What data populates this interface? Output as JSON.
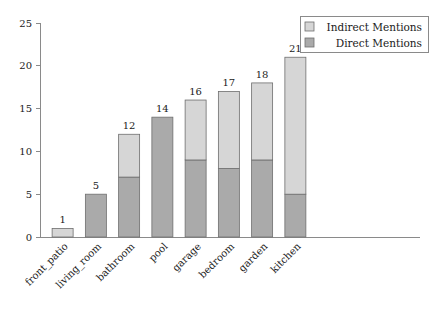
{
  "chart_data": {
    "type": "bar",
    "subtype": "stacked-vertical",
    "title": "",
    "subtitle": "",
    "xlabel": "",
    "ylabel": "",
    "categories": [
      "front_patio",
      "living_room",
      "bathroom",
      "pool",
      "garage",
      "bedroom",
      "garden",
      "kitchen"
    ],
    "series": [
      {
        "name": "Direct Mentions",
        "color": "#aaaaaa",
        "values": [
          0,
          5,
          7,
          14,
          9,
          8,
          9,
          5
        ]
      },
      {
        "name": "Indirect Mentions",
        "color": "#d6d6d6",
        "values": [
          1,
          0,
          5,
          0,
          7,
          9,
          9,
          16
        ]
      }
    ],
    "totals": [
      1,
      5,
      12,
      14,
      16,
      17,
      18,
      21
    ],
    "total_labels": [
      "1",
      "5",
      "12",
      "14",
      "16",
      "17",
      "18",
      "21"
    ],
    "ylim": [
      0,
      25
    ],
    "yticks": [
      0,
      5,
      10,
      15,
      20,
      25
    ],
    "ytick_labels": [
      "0",
      "5",
      "10",
      "15",
      "20",
      "25"
    ],
    "grid": false,
    "legend_position": "top-right",
    "legend_entries": [
      {
        "label": "Indirect Mentions",
        "color": "#d6d6d6"
      },
      {
        "label": "Direct Mentions",
        "color": "#aaaaaa"
      }
    ],
    "axis_color": "#8a8a8a",
    "bar_edge_color": "#6e6e6e",
    "background": "#ffffff"
  }
}
